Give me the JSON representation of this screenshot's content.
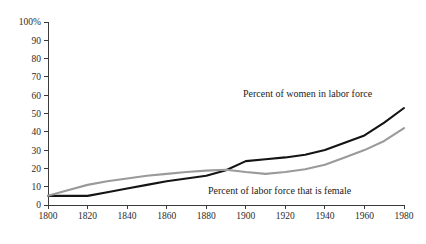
{
  "chart_data": {
    "type": "line",
    "title": "",
    "xlabel": "",
    "ylabel": "",
    "xlim": [
      1800,
      1980
    ],
    "ylim": [
      0,
      100
    ],
    "grid": false,
    "legend_position": "inline-annotations",
    "x_tick_labels": [
      "1800",
      "1820",
      "1840",
      "1860",
      "1880",
      "1900",
      "1920",
      "1940",
      "1960",
      "1980"
    ],
    "x_ticks": [
      1800,
      1820,
      1840,
      1860,
      1880,
      1900,
      1920,
      1940,
      1960,
      1980
    ],
    "y_tick_labels": [
      "0",
      "10",
      "20",
      "30",
      "40",
      "50",
      "60",
      "70",
      "80",
      "90",
      "100%"
    ],
    "y_ticks": [
      0,
      10,
      20,
      30,
      40,
      50,
      60,
      70,
      80,
      90,
      100
    ],
    "x": [
      1800,
      1810,
      1820,
      1830,
      1840,
      1850,
      1860,
      1870,
      1880,
      1890,
      1900,
      1910,
      1920,
      1930,
      1940,
      1950,
      1960,
      1970,
      1980
    ],
    "series": [
      {
        "name": "Percent of women in labor force",
        "color": "#141414",
        "width": 2.1,
        "values": [
          5,
          5,
          5,
          7,
          9,
          11,
          13,
          14.5,
          16,
          19,
          24,
          25,
          26,
          27.5,
          30,
          34,
          38,
          45,
          53
        ]
      },
      {
        "name": "Percent of labor force that is female",
        "color": "#9a9a9a",
        "width": 2.1,
        "values": [
          5,
          8,
          11,
          13,
          14.5,
          16,
          17,
          18,
          18.8,
          19.3,
          18,
          17,
          18,
          19.5,
          22,
          26,
          30,
          35,
          42
        ]
      }
    ],
    "annotations": [
      {
        "id": "women-in-labor-force",
        "text": "Percent of women in labor force",
        "x_px": 243,
        "y_px": 97
      },
      {
        "id": "labor-force-that-is-female",
        "text": "Percent of labor force that is female",
        "x_px": 208,
        "y_px": 194
      }
    ],
    "geometry": {
      "plot_left": 48,
      "plot_right": 404,
      "plot_top": 22,
      "plot_bottom": 205,
      "tick_len": 4
    },
    "colors": {
      "axis": "#3a3a3a",
      "text": "#2b2b2b",
      "background": "#ffffff",
      "series_black": "#141414",
      "series_gray": "#9a9a9a"
    }
  }
}
